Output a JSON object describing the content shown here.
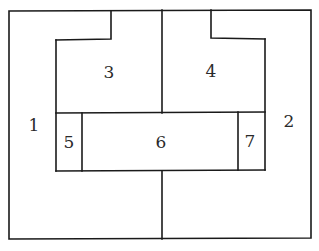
{
  "diagram": {
    "type": "region-partition",
    "colors": {
      "line": "#1a1a1a",
      "background": "#ffffff",
      "label": "#2a2a2a"
    },
    "regions": [
      {
        "id": "1",
        "label": "1",
        "x": 34,
        "y": 125
      },
      {
        "id": "2",
        "label": "2",
        "x": 289,
        "y": 121
      },
      {
        "id": "3",
        "label": "3",
        "x": 109,
        "y": 72
      },
      {
        "id": "4",
        "label": "4",
        "x": 211,
        "y": 71
      },
      {
        "id": "5",
        "label": "5",
        "x": 69,
        "y": 142
      },
      {
        "id": "6",
        "label": "6",
        "x": 161,
        "y": 142
      },
      {
        "id": "7",
        "label": "7",
        "x": 250,
        "y": 141
      }
    ]
  }
}
